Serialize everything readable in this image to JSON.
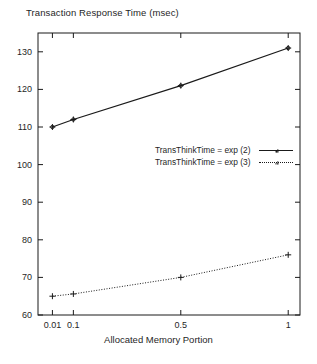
{
  "chart_data": {
    "type": "line",
    "title": "Transaction Response Time (msec)",
    "xlabel": "Allocated Memory Portion",
    "ylabel": "",
    "categories": [
      "0.01",
      "0.1",
      "0.5",
      "1"
    ],
    "x_positions": [
      0.01,
      0.1,
      0.5,
      1
    ],
    "xtick_labels": [
      "0.01",
      "0.1",
      "0.5",
      "1"
    ],
    "ytick_labels": [
      "60",
      "70",
      "80",
      "90",
      "100",
      "110",
      "120",
      "130"
    ],
    "ylim": [
      60,
      135
    ],
    "grid": false,
    "legend_position": "center-right",
    "series": [
      {
        "name": "TransThinkTime = exp (2)",
        "values": [
          110,
          112,
          121,
          131
        ],
        "line_style": "solid",
        "marker": "plus-circle",
        "color": "#1a1a1a"
      },
      {
        "name": "TransThinkTime = exp (3)",
        "values": [
          65,
          65.6,
          70,
          76
        ],
        "line_style": "dotted",
        "marker": "plus",
        "color": "#1a1a1a"
      }
    ]
  },
  "axes": {
    "title": "Transaction Response Time (msec)",
    "xlabel": "Allocated Memory Portion"
  },
  "legend": {
    "entries": [
      {
        "label": "TransThinkTime = exp (2)"
      },
      {
        "label": "TransThinkTime = exp (3)"
      }
    ]
  }
}
